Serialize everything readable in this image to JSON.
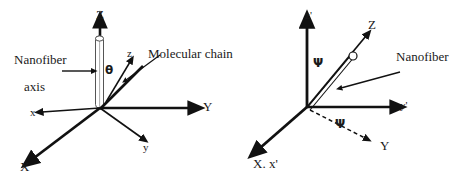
{
  "figure": {
    "type": "scientific-diagram",
    "background_color": "#ffffff",
    "ink_color": "#111111"
  },
  "left_diagram": {
    "name": "molecular-chain-orientation",
    "axes": [
      {
        "id": "Z",
        "label": "Z",
        "kind": "capital-vertical"
      },
      {
        "id": "Y",
        "label": "Y",
        "kind": "capital-right"
      },
      {
        "id": "X",
        "label": "X",
        "kind": "capital-lower-left"
      },
      {
        "id": "z",
        "label": "z",
        "kind": "lowercase-diagonal"
      },
      {
        "id": "y",
        "label": "y",
        "kind": "lowercase-lower-right"
      },
      {
        "id": "x",
        "label": "x",
        "kind": "lowercase-left"
      }
    ],
    "angle_symbol": "θ",
    "callouts": [
      {
        "id": "nanofiber-axis",
        "line1": "Nanofiber",
        "line2": "axis"
      },
      {
        "id": "molecular-chain",
        "text": "Molecular chain"
      }
    ]
  },
  "right_diagram": {
    "name": "nanofiber-rotation",
    "axes": [
      {
        "id": "z-prime",
        "label": "z'",
        "kind": "lowercase-vertical"
      },
      {
        "id": "Z",
        "label": "Z",
        "kind": "capital-diagonal"
      },
      {
        "id": "y-prime",
        "label": "y'",
        "kind": "lowercase-right"
      },
      {
        "id": "Y",
        "label": "Y",
        "kind": "capital-dashed-lower-right"
      },
      {
        "id": "X-x-prime",
        "label": "X. x'",
        "kind": "merged-lower-left"
      }
    ],
    "angle_symbol_upper": "Ψ",
    "angle_symbol_lower": "Ψ",
    "callouts": [
      {
        "id": "nanofiber",
        "text": "Nanofiber"
      }
    ]
  }
}
